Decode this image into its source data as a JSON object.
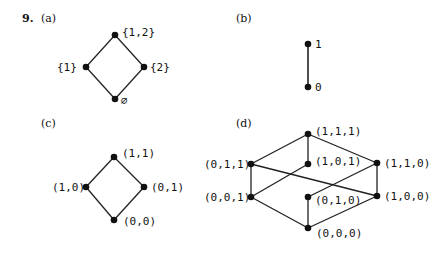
{
  "problem_number": "9.",
  "parts": [
    {
      "label": "(a)",
      "nodes": {
        "top": "{1,2}",
        "left": "{1}",
        "right": "{2}",
        "bottom": "∅"
      }
    },
    {
      "label": "(b)",
      "nodes": {
        "top": "1",
        "bottom": "0"
      }
    },
    {
      "label": "(c)",
      "nodes": {
        "top": "(1,1)",
        "left": "(1,0)",
        "right": "(0,1)",
        "bottom": "(0,0)"
      }
    },
    {
      "label": "(d)",
      "nodes": {
        "n111": "(1,1,1)",
        "n101": "(1,0,1)",
        "n011": "(0,1,1)",
        "n110": "(1,1,0)",
        "n001": "(0,0,1)",
        "n010": "(0,1,0)",
        "n100": "(1,0,0)",
        "n000": "(0,0,0)"
      }
    }
  ]
}
